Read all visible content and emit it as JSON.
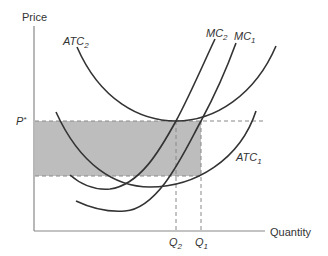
{
  "diagram": {
    "title": "",
    "y_axis_label": "Price",
    "x_axis_label": "Quantity",
    "price_label": {
      "main": "P",
      "sup": "*"
    },
    "quantity_labels": [
      {
        "main": "Q",
        "sub": "2"
      },
      {
        "main": "Q",
        "sub": "1"
      }
    ],
    "curves": [
      {
        "name": "ATC",
        "sub": "2",
        "shape": "U-shaped average total cost (higher)"
      },
      {
        "name": "MC",
        "sub": "2",
        "shape": "marginal cost (shifted left)"
      },
      {
        "name": "MC",
        "sub": "1",
        "shape": "marginal cost"
      },
      {
        "name": "ATC",
        "sub": "1",
        "shape": "U-shaped average total cost (lower)"
      }
    ],
    "shaded_region": "Profit rectangle between P* and ATC1 at Q1",
    "colors": {
      "curve": "#333333",
      "axis": "#888888",
      "dashed": "#888888",
      "shade": "#bdbdbd"
    }
  }
}
